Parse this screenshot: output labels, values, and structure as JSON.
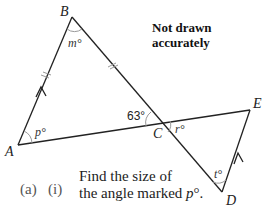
{
  "diagram": {
    "note_line1": "Not drawn",
    "note_line2": "accurately",
    "points": {
      "A": {
        "label": "A"
      },
      "B": {
        "label": "B"
      },
      "C": {
        "label": "C"
      },
      "D": {
        "label": "D"
      },
      "E": {
        "label": "E"
      }
    },
    "angles": {
      "m": "m°",
      "p": "p°",
      "given": "63°",
      "r": "r°",
      "t": "t°"
    },
    "stroke_color": "#222222"
  },
  "question": {
    "part": "(a)",
    "subpart": "(i)",
    "line1": "Find the size of",
    "line2_prefix": "the angle marked ",
    "line2_var": "p",
    "line2_suffix": "°."
  }
}
